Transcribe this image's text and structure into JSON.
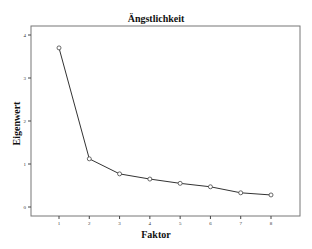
{
  "chart_data": {
    "type": "line",
    "title": "Ängstlichkeit",
    "xlabel": "Faktor",
    "ylabel": "Eigenwert",
    "categories": [
      "1",
      "2",
      "3",
      "4",
      "5",
      "6",
      "7",
      "8"
    ],
    "x": [
      1,
      2,
      3,
      4,
      5,
      6,
      7,
      8
    ],
    "values": [
      3.7,
      1.12,
      0.77,
      0.65,
      0.55,
      0.47,
      0.33,
      0.28
    ],
    "yticks": [
      "0",
      "1",
      "2",
      "3",
      "4"
    ],
    "ylim": [
      -0.2,
      4.2
    ],
    "xlim": [
      0.1,
      8.9
    ],
    "grid": false,
    "legend": null,
    "marker": "circle",
    "line_color": "#333333"
  }
}
